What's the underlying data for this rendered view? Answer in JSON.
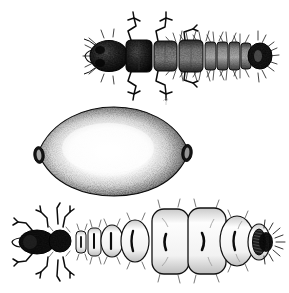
{
  "plate": {
    "title": "Insect life-stage plate",
    "medium": "stipple engraving",
    "background_color": "#ffffff",
    "ink_color": "#111111",
    "width": 289,
    "height": 293,
    "figure_count": 3,
    "caption": ""
  },
  "figures": [
    {
      "id": "larva",
      "label": "larva-dorsal-view",
      "order": 1,
      "description": "Larva in dorsal view with dark head capsule, thoracic legs and setose abdominal segments",
      "orientation": "horizontal, head at left",
      "bbox": {
        "x": 88,
        "y": 16,
        "w": 187,
        "h": 80
      },
      "parts": {
        "head": {
          "name": "head-capsule",
          "fill": "#1a1a1a",
          "cx": 108,
          "cy": 56,
          "rx": 18,
          "ry": 15
        },
        "thorax_segments": 3,
        "abdomen_segments": 9,
        "legs": 6,
        "tail": {
          "name": "tail-tip",
          "fill": "#151515",
          "cx": 255,
          "cy": 56
        }
      },
      "shading": "dark mottled head and thorax, medium grey abdomen with pale segment margins"
    },
    {
      "id": "egg",
      "label": "egg-citriform",
      "order": 2,
      "description": "Lemon-shaped (citriform) egg or cyst, heavily stippled at margins fading to pale centre, with dark opercular knobs at both poles",
      "orientation": "horizontal long axis",
      "bbox": {
        "x": 33,
        "y": 107,
        "w": 161,
        "h": 90
      },
      "parts": {
        "body": {
          "name": "egg-body",
          "cx": 113,
          "cy": 152,
          "rx": 76,
          "ry": 44
        },
        "pole_left": {
          "name": "egg-operculum-left",
          "cx": 39,
          "cy": 155,
          "rx": 5,
          "ry": 8,
          "fill": "#151515"
        },
        "pole_right": {
          "name": "egg-operculum-right",
          "cx": 187,
          "cy": 153,
          "rx": 5,
          "ry": 8,
          "fill": "#151515"
        }
      },
      "shading": "dense stipple rim, light highlight through the centre"
    },
    {
      "id": "gravid-female",
      "label": "engorged-gravid-female-dorsal-view",
      "order": 3,
      "description": "Engorged gravid female: small dark head and prothorax at left, then progressively enlarging pale abdominal segments each with a dark central slit, ending in a dark hatched terminal segment with radiating bristles",
      "orientation": "horizontal, head at left",
      "bbox": {
        "x": 18,
        "y": 203,
        "w": 260,
        "h": 86
      },
      "parts": {
        "head": {
          "name": "head",
          "fill": "#141414",
          "cx": 36,
          "cy": 242
        },
        "prothorax": {
          "name": "prothorax",
          "fill": "#141414",
          "cx": 60,
          "cy": 241
        },
        "legs": 6,
        "abdomen_segments": 8,
        "terminal_segment": {
          "name": "terminal-segment",
          "fill": "#171717",
          "cx": 253,
          "cy": 242
        },
        "segment_marks": "dark vertical bracket / slit on each abdominal tergite"
      },
      "shading": "outline drawing with pale segments, heavy black head and terminal segment"
    }
  ],
  "colors": {
    "ink": "#111111",
    "ink_mid": "#555555",
    "ink_light": "#9a9a9a",
    "paper": "#ffffff"
  }
}
